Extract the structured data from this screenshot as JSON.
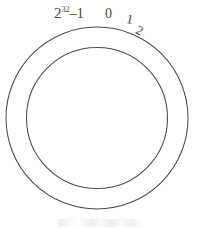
{
  "figure": {
    "shape": "annulus",
    "background_color": "#ffffff",
    "stroke_color": "#4a4a4a"
  },
  "ring": {
    "center_x": 97,
    "center_y": 118,
    "outer_radius": 91,
    "inner_radius": 70,
    "stroke_width": 1
  },
  "labels": {
    "max_base": "2",
    "max_exponent": "32",
    "max_suffix": "–1",
    "zero": "0",
    "one": "1",
    "two": "2"
  },
  "caption": {
    "text": ""
  }
}
